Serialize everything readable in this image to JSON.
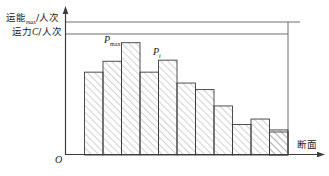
{
  "figure": {
    "axes": {
      "y_label_upper": "运能max/人次",
      "y_label_upper_main": "运能",
      "y_label_upper_sub": "max",
      "y_label_upper_tail": "/人次",
      "y_label_lower": "运力C/人次",
      "y_label_lower_main": "运力",
      "y_label_lower_var": "C",
      "y_label_lower_tail": "/人次",
      "x_label": "断面",
      "origin_label": "O"
    },
    "annotations": [
      {
        "name": "p-max",
        "text": "P",
        "sub": "max",
        "bar_index": 3
      },
      {
        "name": "p-i",
        "text": "P",
        "sub": "i",
        "bar_index": 5
      }
    ],
    "reference_lines": [
      {
        "name": "capacity-max-line",
        "label": "运能max/人次",
        "y": 22
      },
      {
        "name": "capacity-c-line",
        "label": "运力C/人次",
        "y": 34
      }
    ],
    "colors": {
      "stroke": "#3c3c3c",
      "hatch": "#9a9a9a",
      "fill": "#ffffff",
      "text": "#1a1a1a"
    }
  },
  "chart_data": {
    "type": "bar",
    "title": "",
    "xlabel": "断面",
    "ylabel": "运能max/人次",
    "categories": [
      "1",
      "2",
      "3",
      "4",
      "5",
      "6",
      "7",
      "8",
      "9",
      "10",
      "11",
      "12"
    ],
    "values": [
      66,
      76,
      86,
      103,
      76,
      87,
      66,
      60,
      45,
      28,
      33,
      23
    ],
    "series": [
      {
        "name": "断面客流量",
        "values": [
          66,
          76,
          86,
          103,
          76,
          87,
          66,
          60,
          45,
          28,
          33,
          23
        ]
      }
    ],
    "ylim": [
      0,
      125
    ],
    "reference_values": [
      {
        "name": "运能max",
        "value": 122
      },
      {
        "name": "运力C",
        "value": 111
      }
    ],
    "grid": false,
    "legend": "none",
    "annotated_points": [
      {
        "label": "P_max",
        "category": "4",
        "value": 103
      },
      {
        "label": "P_i",
        "category": "6",
        "value": 87
      }
    ]
  }
}
